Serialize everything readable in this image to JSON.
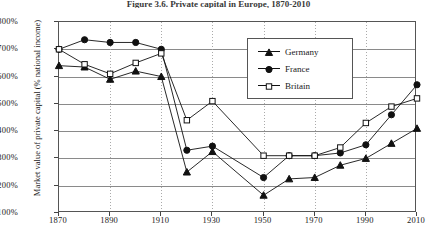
{
  "chart_data": {
    "type": "line",
    "title": "Figure 3.6. Private capital in Europe, 1870-2010",
    "xlabel": "",
    "ylabel": "Market value of private capital (% national income)",
    "x": [
      1870,
      1880,
      1890,
      1900,
      1910,
      1920,
      1930,
      1950,
      1960,
      1970,
      1980,
      1990,
      2000,
      2010
    ],
    "xticks": [
      "1870",
      "1890",
      "1910",
      "1930",
      "1950",
      "1970",
      "1990",
      "2010"
    ],
    "xtick_values": [
      1870,
      1890,
      1910,
      1930,
      1950,
      1970,
      1990,
      2010
    ],
    "yticks": [
      "100%",
      "200%",
      "300%",
      "400%",
      "500%",
      "600%",
      "700%",
      "800%"
    ],
    "ytick_values": [
      100,
      200,
      300,
      400,
      500,
      600,
      700,
      800
    ],
    "xlim": [
      1870,
      2010
    ],
    "ylim": [
      100,
      800
    ],
    "grid": true,
    "legend_position": "top-right",
    "series": [
      {
        "name": "Germany",
        "marker": "filled-triangle",
        "color": "#111111",
        "values": [
          640,
          635,
          590,
          620,
          600,
          250,
          325,
          165,
          225,
          230,
          275,
          300,
          355,
          410
        ]
      },
      {
        "name": "France",
        "marker": "filled-circle",
        "color": "#111111",
        "values": [
          700,
          735,
          725,
          725,
          700,
          330,
          345,
          230,
          310,
          310,
          320,
          350,
          460,
          570
        ]
      },
      {
        "name": "Britain",
        "marker": "open-square",
        "color": "#111111",
        "values": [
          700,
          645,
          610,
          650,
          685,
          440,
          510,
          310,
          310,
          310,
          340,
          430,
          490,
          520
        ]
      }
    ]
  }
}
